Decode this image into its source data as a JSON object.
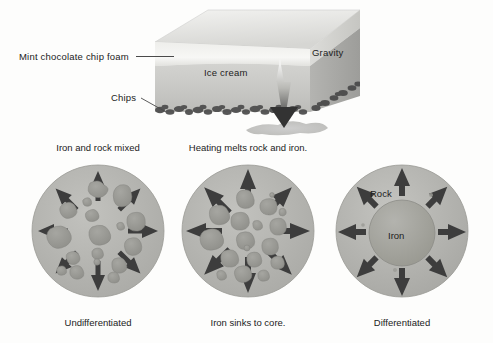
{
  "figure": {
    "background_color": "#fdfdfc"
  },
  "top_panel": {
    "name": "ice-cream-analogy",
    "labels": {
      "foam": "Mint chocolate chip foam",
      "ice_cream": "Ice cream",
      "chips": "Chips",
      "gravity": "Gravity"
    },
    "colors": {
      "foam": "#e9e9e5",
      "ice_cream": "#c9c9c6",
      "block_top": "#dedede",
      "block_side": "#a9a9a7",
      "chips": "#4a4a4a",
      "puddle": "#c4c4c2",
      "arrow_dark": "#3a3a3a"
    }
  },
  "circles": [
    {
      "id": "undifferentiated",
      "title": "Iron and rock mixed",
      "caption": "Undifferentiated",
      "inner_labels": [],
      "body_color": "#b6b6b2",
      "blob_color": "#9a9a95",
      "arrow_color": "#3d3d3d",
      "arrow_count": 8,
      "has_core": false,
      "blob_count": 17
    },
    {
      "id": "heating",
      "title": "Heating melts rock and iron.",
      "caption": "Iron sinks to core.",
      "inner_labels": [],
      "body_color": "#b6b6b2",
      "blob_color": "#9a9a95",
      "arrow_color": "#3d3d3d",
      "arrow_count": 8,
      "has_core": false,
      "blob_count": 16
    },
    {
      "id": "differentiated",
      "title": "",
      "caption": "Differentiated",
      "inner_labels": [
        "Rock",
        "Iron"
      ],
      "body_color": "#b6b6b2",
      "blob_color": "#9a9a95",
      "arrow_color": "#3d3d3d",
      "arrow_count": 8,
      "has_core": true,
      "core_color": "#a2a29d",
      "blob_count": 0
    }
  ]
}
